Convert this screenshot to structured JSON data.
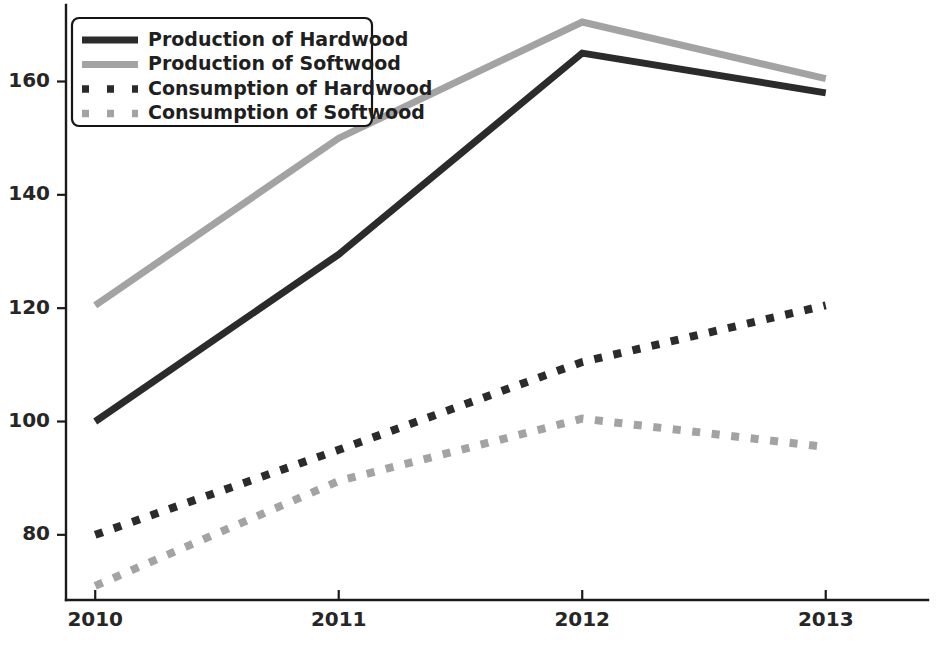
{
  "chart_data": {
    "type": "line",
    "title": "",
    "xlabel": "",
    "ylabel": "",
    "x": [
      2010,
      2011,
      2012,
      2013
    ],
    "categories": [
      "2010",
      "2011",
      "2012",
      "2013"
    ],
    "xtick_labels": [
      "2010",
      "2011",
      "2012",
      "2013"
    ],
    "ytick_labels": [
      "80",
      "100",
      "120",
      "140",
      "160"
    ],
    "ytick_values": [
      80,
      100,
      120,
      140,
      160
    ],
    "xlim": [
      2009.88,
      2013.42
    ],
    "ylim": [
      68.5,
      173.5
    ],
    "grid": false,
    "legend_position": "upper left",
    "series": [
      {
        "name": "Production of Hardwood",
        "values": [
          100,
          129.5,
          165,
          158
        ],
        "style": "solid",
        "color": "#2b2b2b",
        "width": 7
      },
      {
        "name": "Production of Softwood",
        "values": [
          120.5,
          150,
          170.5,
          160.5
        ],
        "style": "solid",
        "color": "#a3a3a3",
        "width": 7
      },
      {
        "name": "Consumption of Hardwood",
        "values": [
          80,
          95,
          110.5,
          120.5
        ],
        "style": "dotted",
        "color": "#2b2b2b",
        "width": 8
      },
      {
        "name": "Consumption of Softwood",
        "values": [
          71,
          89.5,
          100.5,
          95.5
        ],
        "style": "dotted",
        "color": "#a3a3a3",
        "width": 8
      }
    ]
  },
  "legend": {
    "entries": [
      "Production of Hardwood",
      "Production of Softwood",
      "Consumption of Hardwood",
      "Consumption of Softwood"
    ]
  },
  "axes": {
    "y_ticks": [
      "80",
      "100",
      "120",
      "140",
      "160"
    ],
    "x_ticks": [
      "2010",
      "2011",
      "2012",
      "2013"
    ]
  },
  "colors": {
    "dark": "#2b2b2b",
    "light": "#a3a3a3",
    "axis": "#1a1a1a",
    "background": "#ffffff"
  }
}
